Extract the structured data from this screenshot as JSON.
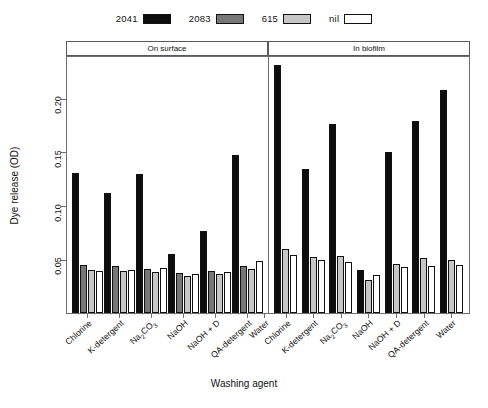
{
  "legend": {
    "entries": [
      {
        "label": "2041",
        "color": "#0d0d0d"
      },
      {
        "label": "2083",
        "color": "#777777"
      },
      {
        "label": "615",
        "color": "#c6c6c6"
      },
      {
        "label": "nil",
        "color": "#ffffff"
      }
    ]
  },
  "panels": [
    {
      "label": "On surface"
    },
    {
      "label": "In biofilm"
    }
  ],
  "axes": {
    "ylabel": "Dye release (OD)",
    "xlabel": "Washing agent",
    "yticks": [
      "0.05",
      "0.10",
      "0.15",
      "0.20"
    ]
  },
  "chart_data": {
    "type": "bar",
    "title": "",
    "xlabel": "Washing agent",
    "ylabel": "Dye release (OD)",
    "ylim": [
      0,
      0.24
    ],
    "ytick_values": [
      0.05,
      0.1,
      0.15,
      0.2
    ],
    "grid": false,
    "legend_position": "top-center",
    "facets": [
      "On surface",
      "In biofilm"
    ],
    "categories": [
      "Chlorine",
      "K-detergent",
      "Na2CO3",
      "NaOH",
      "NaOH + D",
      "QA-detergent",
      "Water"
    ],
    "category_labels_display": [
      "Chlorine",
      "K-detergent",
      "Na₂CO₃",
      "NaOH",
      "NaOH + D",
      "QA-detergent",
      "Water"
    ],
    "panel_data": [
      {
        "panel": "On surface",
        "series": [
          {
            "name": "2041",
            "values": [
              0.13,
              0.112,
              0.129,
              0.055,
              0.076,
              0.147,
              0.0
            ]
          },
          {
            "name": "2083",
            "values": [
              0.045,
              0.044,
              0.041,
              0.037,
              0.039,
              0.044,
              0.0
            ]
          },
          {
            "name": "615",
            "values": [
              0.04,
              0.039,
              0.038,
              0.034,
              0.036,
              0.041,
              0.0
            ]
          },
          {
            "name": "nil",
            "values": [
              0.039,
              0.04,
              0.042,
              0.036,
              0.038,
              0.048,
              0.0
            ]
          }
        ]
      },
      {
        "panel": "In biofilm",
        "series": [
          {
            "name": "2041",
            "values": [
              0.231,
              0.134,
              0.176,
              0.04,
              0.15,
              0.179,
              0.207
            ]
          },
          {
            "name": "2083",
            "values": [
              0.0,
              0.0,
              0.0,
              0.0,
              0.0,
              0.0,
              0.0
            ]
          },
          {
            "name": "615",
            "values": [
              0.06,
              0.052,
              0.053,
              0.031,
              0.046,
              0.051,
              0.049
            ]
          },
          {
            "name": "nil",
            "values": [
              0.054,
              0.049,
              0.047,
              0.035,
              0.043,
              0.044,
              0.045
            ]
          }
        ]
      }
    ]
  }
}
